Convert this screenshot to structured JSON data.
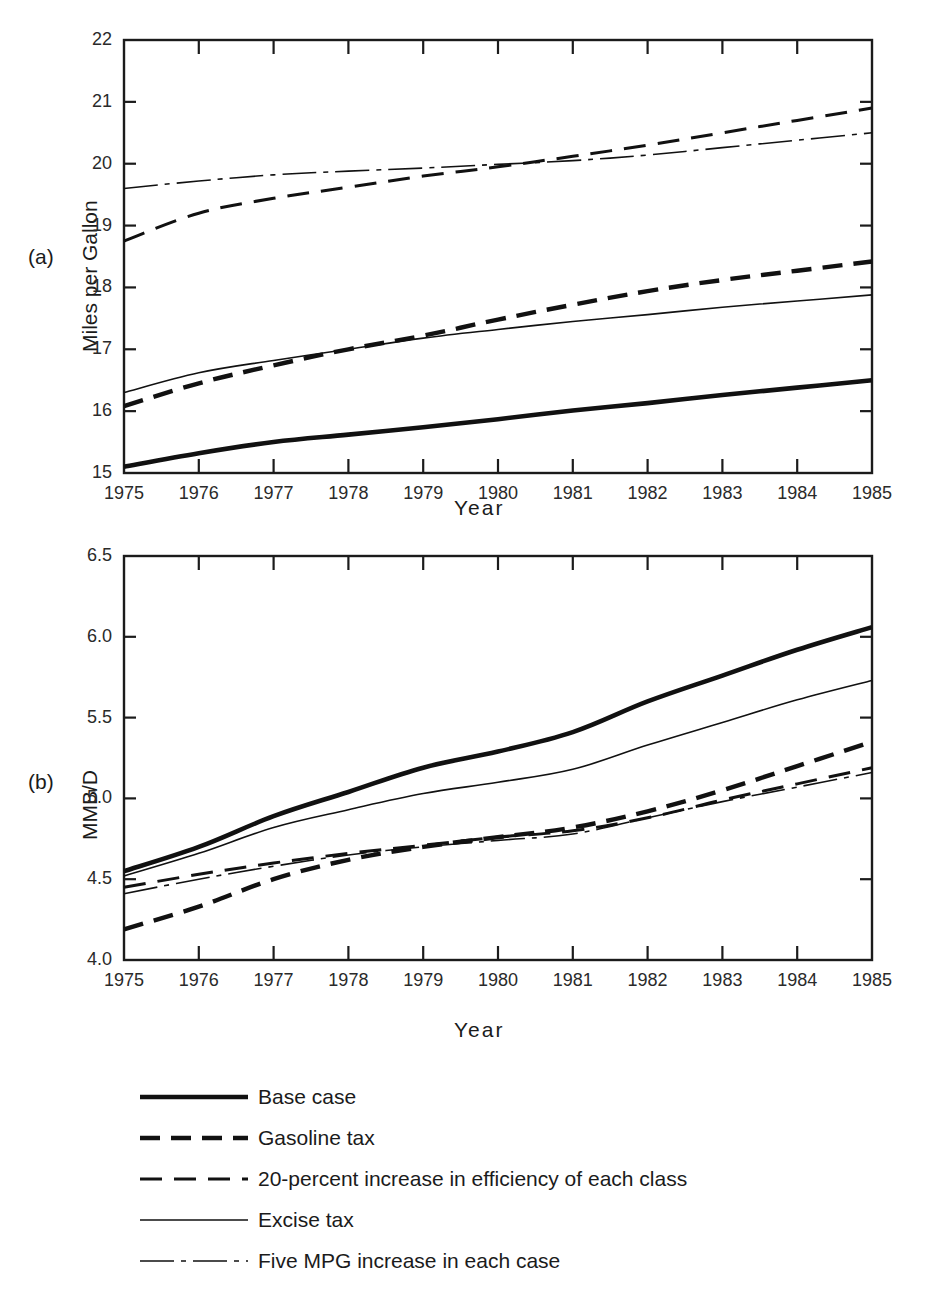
{
  "figure": {
    "panels": [
      {
        "letter": "(a)",
        "ylabel": "Miles per Gallon",
        "xlabel": "Year"
      },
      {
        "letter": "(b)",
        "ylabel": "MMB/D",
        "xlabel": "Year"
      }
    ]
  },
  "legend": {
    "items": [
      {
        "label": "Base case",
        "style": "thick-solid"
      },
      {
        "label": "Gasoline tax",
        "style": "thick-dash"
      },
      {
        "label": "20-percent increase in efficiency of each class",
        "style": "medium-dash"
      },
      {
        "label": "Excise tax",
        "style": "thin-solid"
      },
      {
        "label": "Five MPG increase in each case",
        "style": "thin-dashdot"
      }
    ]
  },
  "chart_data": [
    {
      "type": "line",
      "panel": "(a)",
      "title": "",
      "xlabel": "Year",
      "ylabel": "Miles per Gallon",
      "x": [
        1975,
        1976,
        1977,
        1978,
        1979,
        1980,
        1981,
        1982,
        1983,
        1984,
        1985
      ],
      "xlim": [
        1975,
        1985
      ],
      "ylim": [
        15,
        22
      ],
      "ytick_labels": [
        "15",
        "16",
        "17",
        "18",
        "19",
        "20",
        "21",
        "22"
      ],
      "yticks": [
        15,
        16,
        17,
        18,
        19,
        20,
        21,
        22
      ],
      "xtick_labels": [
        "1975",
        "1976",
        "1977",
        "1978",
        "1979",
        "1980",
        "1981",
        "1982",
        "1983",
        "1984",
        "1985"
      ],
      "grid": false,
      "legend_position": "below-figure",
      "series": [
        {
          "name": "Base case",
          "style": "thick-solid",
          "values": [
            15.1,
            15.32,
            15.5,
            15.62,
            15.74,
            15.87,
            16.01,
            16.13,
            16.26,
            16.38,
            16.5
          ]
        },
        {
          "name": "Gasoline tax",
          "style": "thick-dash",
          "values": [
            16.08,
            16.45,
            16.74,
            17.0,
            17.22,
            17.48,
            17.72,
            17.94,
            18.12,
            18.27,
            18.42
          ]
        },
        {
          "name": "20-percent increase in efficiency of each class",
          "style": "medium-dash",
          "values": [
            18.75,
            19.2,
            19.44,
            19.62,
            19.8,
            19.95,
            20.12,
            20.3,
            20.5,
            20.7,
            20.9
          ]
        },
        {
          "name": "Excise tax",
          "style": "thin-solid",
          "values": [
            16.3,
            16.62,
            16.82,
            17.0,
            17.18,
            17.32,
            17.45,
            17.56,
            17.68,
            17.78,
            17.88
          ]
        },
        {
          "name": "Five MPG increase in each case",
          "style": "thin-dashdot",
          "values": [
            19.6,
            19.72,
            19.82,
            19.88,
            19.93,
            19.99,
            20.05,
            20.14,
            20.26,
            20.38,
            20.5
          ]
        }
      ]
    },
    {
      "type": "line",
      "panel": "(b)",
      "title": "",
      "xlabel": "Year",
      "ylabel": "MMB/D",
      "x": [
        1975,
        1976,
        1977,
        1978,
        1979,
        1980,
        1981,
        1982,
        1983,
        1984,
        1985
      ],
      "xlim": [
        1975,
        1985
      ],
      "ylim": [
        4.0,
        6.5
      ],
      "ytick_labels": [
        "4.0",
        "4.5",
        "5.0",
        "5.5",
        "6.0",
        "6.5"
      ],
      "yticks": [
        4.0,
        4.5,
        5.0,
        5.5,
        6.0,
        6.5
      ],
      "xtick_labels": [
        "1975",
        "1976",
        "1977",
        "1978",
        "1979",
        "1980",
        "1981",
        "1982",
        "1983",
        "1984",
        "1985"
      ],
      "grid": false,
      "legend_position": "below-figure",
      "series": [
        {
          "name": "Base case",
          "style": "thick-solid",
          "values": [
            4.55,
            4.7,
            4.89,
            5.04,
            5.19,
            5.29,
            5.41,
            5.6,
            5.76,
            5.92,
            6.06
          ]
        },
        {
          "name": "Gasoline tax",
          "style": "thick-dash",
          "values": [
            4.19,
            4.33,
            4.5,
            4.62,
            4.7,
            4.76,
            4.82,
            4.92,
            5.05,
            5.2,
            5.35
          ]
        },
        {
          "name": "20-percent increase in efficiency of each class",
          "style": "medium-dash",
          "values": [
            4.45,
            4.53,
            4.6,
            4.66,
            4.71,
            4.76,
            4.8,
            4.88,
            4.99,
            5.09,
            5.19
          ]
        },
        {
          "name": "Excise tax",
          "style": "thin-solid",
          "values": [
            4.52,
            4.66,
            4.82,
            4.93,
            5.03,
            5.1,
            5.18,
            5.33,
            5.47,
            5.61,
            5.73
          ]
        },
        {
          "name": "Five MPG increase in each case",
          "style": "thin-dashdot",
          "values": [
            4.41,
            4.5,
            4.58,
            4.65,
            4.7,
            4.74,
            4.78,
            4.88,
            4.98,
            5.07,
            5.16
          ]
        }
      ]
    }
  ]
}
